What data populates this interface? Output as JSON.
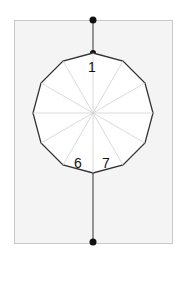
{
  "diagram": {
    "type": "dodecagon-on-vertical-line",
    "frame": {
      "x": 14,
      "y": 20,
      "width": 158,
      "height": 223,
      "fill": "#f4f4f4",
      "border": "#c8c8c8"
    },
    "vertical_line": {
      "x": 93,
      "y1": 20,
      "y2": 242,
      "color": "#333333"
    },
    "end_dots": [
      {
        "x": 93,
        "y": 20
      },
      {
        "x": 93,
        "y": 242
      }
    ],
    "polygon": {
      "sides": 12,
      "center": {
        "x": 93,
        "y": 113
      },
      "radius": 60,
      "stroke": "#333333",
      "fill": "#ffffff",
      "spoke_color": "#d0d0d0"
    },
    "labels": [
      {
        "text": "1",
        "x": 88,
        "y": 60
      },
      {
        "text": "6",
        "x": 74,
        "y": 156
      },
      {
        "text": "7",
        "x": 102,
        "y": 156
      }
    ]
  }
}
